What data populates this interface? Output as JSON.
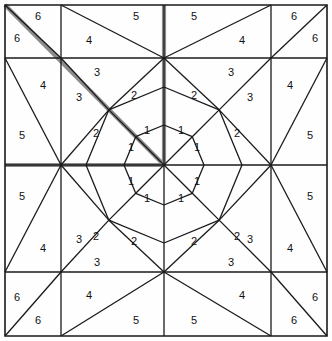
{
  "figure": {
    "width": 332,
    "height": 341,
    "background_color": "#fefefe",
    "line_color": "#1a1a1a",
    "highlight_color": "#8c8c8c",
    "border_color": "#1a1a1a",
    "label_color": "#111111"
  },
  "geometry": {
    "center": {
      "x": 164,
      "y": 165
    },
    "grid_x": [
      5,
      61,
      164,
      271,
      327
    ],
    "grid_y": [
      5,
      58,
      165,
      272,
      336
    ],
    "inner_octagon_radius": 40,
    "middle_ring_radius": 78,
    "symmetry": "4-fold dihedral",
    "highlight_paths": [
      "corner-diagonal-to-center",
      "left-edge-horizontal-to-center",
      "top-edge-vertical-to-center"
    ]
  },
  "regions": [
    {
      "id": "r1-nnw",
      "label": "1",
      "x": 147,
      "y": 131
    },
    {
      "id": "r1-nne",
      "label": "1",
      "x": 181,
      "y": 131
    },
    {
      "id": "r1-wnw",
      "label": "1",
      "x": 131,
      "y": 148
    },
    {
      "id": "r1-ene",
      "label": "1",
      "x": 197,
      "y": 148
    },
    {
      "id": "r1-wsw",
      "label": "1",
      "x": 131,
      "y": 182
    },
    {
      "id": "r1-ese",
      "label": "1",
      "x": 197,
      "y": 182
    },
    {
      "id": "r1-ssw",
      "label": "1",
      "x": 147,
      "y": 199
    },
    {
      "id": "r1-sse",
      "label": "1",
      "x": 181,
      "y": 199
    },
    {
      "id": "r2-nnw",
      "label": "2",
      "x": 134,
      "y": 96
    },
    {
      "id": "r2-nne",
      "label": "2",
      "x": 194,
      "y": 96
    },
    {
      "id": "r2-wnw",
      "label": "2",
      "x": 96,
      "y": 134
    },
    {
      "id": "r2-ene",
      "label": "2",
      "x": 237,
      "y": 134
    },
    {
      "id": "r2-wsw",
      "label": "2",
      "x": 96,
      "y": 237
    },
    {
      "id": "r2-ese",
      "label": "2",
      "x": 237,
      "y": 237
    },
    {
      "id": "r2-ssw",
      "label": "2",
      "x": 134,
      "y": 242
    },
    {
      "id": "r2-sse",
      "label": "2",
      "x": 194,
      "y": 242
    },
    {
      "id": "r3-nw-a",
      "label": "3",
      "x": 97,
      "y": 73
    },
    {
      "id": "r3-nw-b",
      "label": "3",
      "x": 79,
      "y": 98
    },
    {
      "id": "r3-ne-a",
      "label": "3",
      "x": 231,
      "y": 73
    },
    {
      "id": "r3-ne-b",
      "label": "3",
      "x": 250,
      "y": 98
    },
    {
      "id": "r3-sw-a",
      "label": "3",
      "x": 79,
      "y": 240
    },
    {
      "id": "r3-sw-b",
      "label": "3",
      "x": 97,
      "y": 263
    },
    {
      "id": "r3-se-a",
      "label": "3",
      "x": 250,
      "y": 240
    },
    {
      "id": "r3-se-b",
      "label": "3",
      "x": 231,
      "y": 263
    },
    {
      "id": "r4-n-w",
      "label": "4",
      "x": 89,
      "y": 41
    },
    {
      "id": "r4-n-e",
      "label": "4",
      "x": 242,
      "y": 41
    },
    {
      "id": "r4-w-n",
      "label": "4",
      "x": 43,
      "y": 86
    },
    {
      "id": "r4-e-n",
      "label": "4",
      "x": 290,
      "y": 86
    },
    {
      "id": "r4-w-s",
      "label": "4",
      "x": 43,
      "y": 249
    },
    {
      "id": "r4-e-s",
      "label": "4",
      "x": 290,
      "y": 249
    },
    {
      "id": "r4-s-w",
      "label": "4",
      "x": 89,
      "y": 296
    },
    {
      "id": "r4-s-e",
      "label": "4",
      "x": 242,
      "y": 296
    },
    {
      "id": "r5-n-w",
      "label": "5",
      "x": 136,
      "y": 17
    },
    {
      "id": "r5-n-e",
      "label": "5",
      "x": 194,
      "y": 17
    },
    {
      "id": "r5-w-n",
      "label": "5",
      "x": 22,
      "y": 136
    },
    {
      "id": "r5-e-n",
      "label": "5",
      "x": 310,
      "y": 136
    },
    {
      "id": "r5-w-s",
      "label": "5",
      "x": 22,
      "y": 197
    },
    {
      "id": "r5-e-s",
      "label": "5",
      "x": 310,
      "y": 197
    },
    {
      "id": "r5-s-w",
      "label": "5",
      "x": 136,
      "y": 321
    },
    {
      "id": "r5-s-e",
      "label": "5",
      "x": 194,
      "y": 321
    },
    {
      "id": "r6-nw-a",
      "label": "6",
      "x": 38,
      "y": 17
    },
    {
      "id": "r6-nw-b",
      "label": "6",
      "x": 17,
      "y": 39
    },
    {
      "id": "r6-ne-a",
      "label": "6",
      "x": 294,
      "y": 17
    },
    {
      "id": "r6-ne-b",
      "label": "6",
      "x": 315,
      "y": 39
    },
    {
      "id": "r6-sw-a",
      "label": "6",
      "x": 17,
      "y": 298
    },
    {
      "id": "r6-sw-b",
      "label": "6",
      "x": 38,
      "y": 321
    },
    {
      "id": "r6-se-a",
      "label": "6",
      "x": 315,
      "y": 298
    },
    {
      "id": "r6-se-b",
      "label": "6",
      "x": 294,
      "y": 321
    }
  ]
}
